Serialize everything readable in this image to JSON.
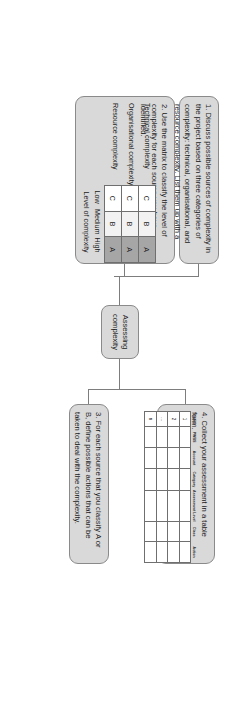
{
  "diagram": {
    "title": "Assessing complexity",
    "hub": {
      "label_line1": "Assessing",
      "label_line2": "complexity"
    },
    "steps": [
      {
        "id": "step-1",
        "text": "1. Discuss possible sources of complexity in the project based on three categories of complexity: technical, organisational, and resource complexity. List them up with a short account of each one."
      },
      {
        "id": "step-2",
        "text": "2. Use the matrix to classify the level of complexity for each source you have identified."
      },
      {
        "id": "step-3",
        "text": "3. For each source that you classify A or B, define possible actions that can be taken to deal with the complexity."
      },
      {
        "id": "step-4",
        "text": "4. Collect your assessment in a table form."
      }
    ]
  },
  "matrix": {
    "row_labels": [
      "Technical complexity",
      "Organisational complexity",
      "Resource complexity"
    ],
    "column_labels": [
      "Low",
      "Medium",
      "High"
    ],
    "axis_title": "Level of complexity",
    "cells": [
      [
        "C",
        "B",
        "A"
      ],
      [
        "C",
        "B",
        "A"
      ],
      [
        "C",
        "B",
        "A"
      ]
    ],
    "cell_classes": [
      [
        "c",
        "b",
        "a"
      ],
      [
        "c",
        "b",
        "a"
      ],
      [
        "c",
        "b",
        "a"
      ]
    ],
    "colors": {
      "low": "#ffffff",
      "medium": "#f2f2f2",
      "high": "#a6a6a6",
      "border": "#6f6f6f"
    }
  },
  "assessment_table": {
    "headers": [
      "Source",
      "PWBS",
      "Account",
      "Category",
      "Assessment Level",
      "Class",
      "Action"
    ],
    "rows": [
      {
        "index": "1",
        "cells": [
          "",
          "",
          "",
          "",
          "",
          ""
        ]
      },
      {
        "index": "2",
        "cells": [
          "",
          "",
          "",
          "",
          "",
          ""
        ]
      },
      {
        "index": "...",
        "cells": [
          "",
          "",
          "",
          "",
          "",
          ""
        ]
      },
      {
        "index": "n",
        "cells": [
          "",
          "",
          "",
          "",
          "",
          ""
        ]
      }
    ]
  },
  "style": {
    "box_fill": "#d9d9d9",
    "box_border": "#8a8a8a",
    "connector": "#7d7d7d",
    "text": "#1a1a1a",
    "page_background": "#ffffff"
  }
}
